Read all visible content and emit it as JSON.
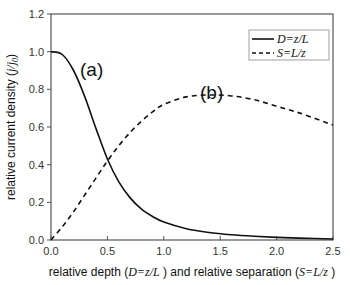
{
  "chart_data": {
    "type": "line",
    "title": "",
    "xlabel": "relative depth (D=z/L ) and relative separation (S=L/z )",
    "ylabel": "relative current density (j/j0)",
    "xlim": [
      0,
      2.5
    ],
    "ylim": [
      0,
      1.2
    ],
    "x_ticks": [
      "0.0",
      "0.5",
      "1.0",
      "1.5",
      "2.0",
      "2.5"
    ],
    "y_ticks": [
      "0.0",
      "0.2",
      "0.4",
      "0.6",
      "0.8",
      "1.0",
      "1.2"
    ],
    "grid": false,
    "legend_position": "upper right",
    "x": [
      0.0,
      0.1,
      0.2,
      0.3,
      0.4,
      0.5,
      0.6,
      0.7,
      0.8,
      0.9,
      1.0,
      1.2,
      1.4,
      1.6,
      1.8,
      2.0,
      2.2,
      2.5
    ],
    "series": [
      {
        "name": "D=z/L",
        "style": "solid",
        "annotation": "(a)",
        "values": [
          1.0,
          0.985,
          0.9,
          0.76,
          0.59,
          0.43,
          0.31,
          0.225,
          0.165,
          0.125,
          0.095,
          0.06,
          0.04,
          0.028,
          0.02,
          0.014,
          0.01,
          0.005
        ]
      },
      {
        "name": "S=L/z",
        "style": "dashed",
        "annotation": "(b)",
        "values": [
          0.0,
          0.07,
          0.15,
          0.24,
          0.33,
          0.42,
          0.5,
          0.57,
          0.63,
          0.68,
          0.72,
          0.76,
          0.77,
          0.765,
          0.745,
          0.71,
          0.675,
          0.61
        ]
      }
    ]
  },
  "axes": {
    "x_title_parts": [
      "relative depth (",
      "D=z/L",
      " ) and relative separation (",
      "S=L/z",
      " )"
    ],
    "y_title_parts": [
      "relative current density (",
      "j/j",
      "0",
      ")"
    ]
  },
  "legend": {
    "items": [
      "D=z/L",
      "S=L/z"
    ]
  },
  "annotations": [
    "(a)",
    "(b)"
  ]
}
